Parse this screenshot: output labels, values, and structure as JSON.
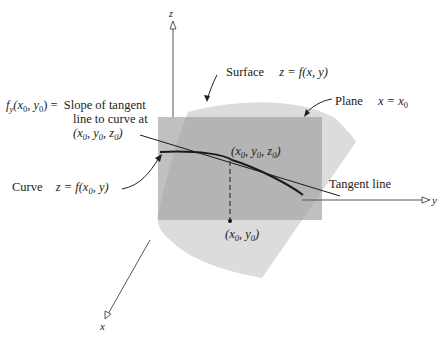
{
  "figure": {
    "type": "3d-partial-derivative-illustration",
    "colors": {
      "surface": "#d9d9d9",
      "plane": "#a8a8a8",
      "axes": "#555555",
      "curve": "#1a1a1a",
      "text": "#222222"
    },
    "axes": {
      "x_label": "x",
      "y_label": "y",
      "z_label": "z"
    },
    "labels": {
      "surface": {
        "name": "Surface",
        "equation": "z = f(x, y)"
      },
      "plane": {
        "name": "Plane",
        "equation_lhs": "x = x",
        "equation_sub": "0"
      },
      "curve": {
        "name": "Curve",
        "equation": "z = f(x",
        "sub": "0",
        "equation_tail": ", y)"
      },
      "tangent": {
        "name": "Tangent line"
      },
      "slope": {
        "lhs_f": "f",
        "lhs_sub": "y",
        "lhs_args": "(x",
        "lhs_args_sub": "0",
        "lhs_args_mid": ", y",
        "lhs_args_sub2": "0",
        "lhs_args_end": ") =",
        "line1": "Slope of tangent",
        "line2": "line to curve at",
        "line3_open": "(x",
        "line3_sub1": "0",
        "line3_mid1": ", y",
        "line3_sub2": "0",
        "line3_mid2": ", z",
        "line3_sub3": "0",
        "line3_close": ")"
      },
      "point3d": {
        "open": "(x",
        "s1": "0",
        "m1": ", y",
        "s2": "0",
        "m2": ", z",
        "s3": "0",
        "close": ")"
      },
      "point2d": {
        "open": "(x",
        "s1": "0",
        "m1": ", y",
        "s2": "0",
        "close": ")"
      }
    }
  }
}
